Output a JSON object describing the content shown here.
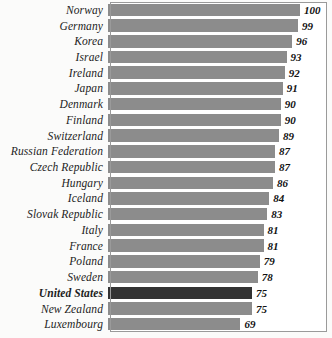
{
  "chart_data": {
    "type": "bar",
    "orientation": "horizontal",
    "title": "",
    "subtitle": "",
    "xlabel": "",
    "ylabel": "",
    "grid": false,
    "legend": null,
    "xlim": [
      0,
      100
    ],
    "categories": [
      "Norway",
      "Germany",
      "Korea",
      "Israel",
      "Ireland",
      "Japan",
      "Denmark",
      "Finland",
      "Switzerland",
      "Russian Federation",
      "Czech Republic",
      "Hungary",
      "Iceland",
      "Slovak Republic",
      "Italy",
      "France",
      "Poland",
      "Sweden",
      "United States",
      "New Zealand",
      "Luxembourg"
    ],
    "values": [
      100,
      99,
      96,
      93,
      92,
      91,
      90,
      90,
      89,
      87,
      87,
      86,
      84,
      83,
      81,
      81,
      79,
      78,
      75,
      75,
      69
    ],
    "highlighted_category": "United States",
    "colors": {
      "bar": "#8c8c8c",
      "bar_highlight": "#333333",
      "frame": "#9a9a9a",
      "plot_background": "#ffffff",
      "page_background": "#fbfbfa",
      "text": "#1d1d1d"
    }
  },
  "chart": {
    "bars": [
      {
        "label": "Norway",
        "value": 100,
        "value_text": "100",
        "highlight": false
      },
      {
        "label": "Germany",
        "value": 99,
        "value_text": "99",
        "highlight": false
      },
      {
        "label": "Korea",
        "value": 96,
        "value_text": "96",
        "highlight": false
      },
      {
        "label": "Israel",
        "value": 93,
        "value_text": "93",
        "highlight": false
      },
      {
        "label": "Ireland",
        "value": 92,
        "value_text": "92",
        "highlight": false
      },
      {
        "label": "Japan",
        "value": 91,
        "value_text": "91",
        "highlight": false
      },
      {
        "label": "Denmark",
        "value": 90,
        "value_text": "90",
        "highlight": false
      },
      {
        "label": "Finland",
        "value": 90,
        "value_text": "90",
        "highlight": false
      },
      {
        "label": "Switzerland",
        "value": 89,
        "value_text": "89",
        "highlight": false
      },
      {
        "label": "Russian Federation",
        "value": 87,
        "value_text": "87",
        "highlight": false
      },
      {
        "label": "Czech Republic",
        "value": 87,
        "value_text": "87",
        "highlight": false
      },
      {
        "label": "Hungary",
        "value": 86,
        "value_text": "86",
        "highlight": false
      },
      {
        "label": "Iceland",
        "value": 84,
        "value_text": "84",
        "highlight": false
      },
      {
        "label": "Slovak Republic",
        "value": 83,
        "value_text": "83",
        "highlight": false
      },
      {
        "label": "Italy",
        "value": 81,
        "value_text": "81",
        "highlight": false
      },
      {
        "label": "France",
        "value": 81,
        "value_text": "81",
        "highlight": false
      },
      {
        "label": "Poland",
        "value": 79,
        "value_text": "79",
        "highlight": false
      },
      {
        "label": "Sweden",
        "value": 78,
        "value_text": "78",
        "highlight": false
      },
      {
        "label": "United States",
        "value": 75,
        "value_text": "75",
        "highlight": true
      },
      {
        "label": "New Zealand",
        "value": 75,
        "value_text": "75",
        "highlight": false
      },
      {
        "label": "Luxembourg",
        "value": 69,
        "value_text": "69",
        "highlight": false
      }
    ]
  }
}
